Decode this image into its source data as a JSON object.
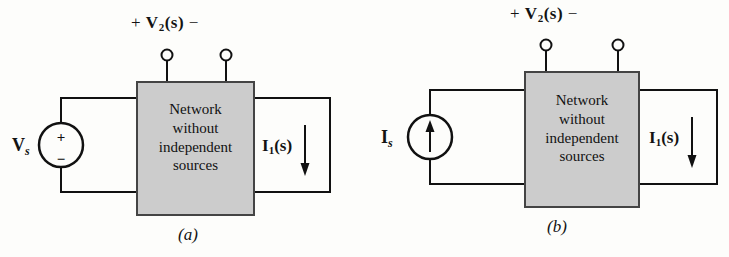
{
  "figure": {
    "background_color": "#fdfdfb",
    "line_color": "#111111",
    "box_fill_color": "#cccccc",
    "box_border_color": "#444444"
  },
  "panels": [
    {
      "id": "a",
      "caption": "(a)",
      "top_label": {
        "plus": "+",
        "quantity": "V",
        "subscript": "2",
        "argument": "(s)",
        "minus": "−"
      },
      "terminals": [
        {
          "name": "terminal-left",
          "x": 167,
          "y": 55
        },
        {
          "name": "terminal-right",
          "x": 226,
          "y": 55
        }
      ],
      "network_box": {
        "lines": [
          "Network",
          "without",
          "independent",
          "sources"
        ],
        "x": 137,
        "y": 82,
        "width": 117,
        "height": 133
      },
      "source": {
        "type": "voltage-source",
        "label": "V",
        "subscript": "s",
        "polarity_top": "+",
        "polarity_bottom": "−",
        "cx": 61,
        "cy": 145,
        "r": 22
      },
      "output": {
        "label": "I",
        "subscript": "1",
        "argument": "(s)",
        "arrow_direction": "down"
      }
    },
    {
      "id": "b",
      "caption": "(b)",
      "top_label": {
        "plus": "+",
        "quantity": "V",
        "subscript": "2",
        "argument": "(s)",
        "minus": "−"
      },
      "terminals": [
        {
          "name": "terminal-left",
          "x": 182,
          "y": 45
        },
        {
          "name": "terminal-right",
          "x": 254,
          "y": 45
        }
      ],
      "network_box": {
        "lines": [
          "Network",
          "without",
          "independent",
          "sources"
        ],
        "x": 161,
        "y": 72,
        "width": 114,
        "height": 135
      },
      "source": {
        "type": "current-source",
        "label": "I",
        "subscript": "s",
        "arrow_direction": "up",
        "cx": 66,
        "cy": 137,
        "r": 22
      },
      "output": {
        "label": "I",
        "subscript": "1",
        "argument": "(s)",
        "arrow_direction": "down"
      }
    }
  ]
}
